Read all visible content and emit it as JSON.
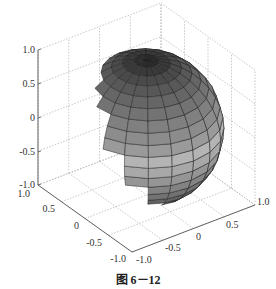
{
  "caption": "图 6－12",
  "colors": {
    "background": "#ffffff",
    "axis_line": "#555555",
    "grid_line": "#b0b0b0",
    "edge_line": "#222222",
    "band_colors": [
      "#2a2a2a",
      "#3a3a3a",
      "#4a4a4a",
      "#585858",
      "#666666",
      "#737373",
      "#808080",
      "#8c8c8c",
      "#9a9a9a",
      "#b4b4b4",
      "#a8a8a8",
      "#959595",
      "#838383",
      "#727272",
      "#626262",
      "#545454",
      "#474747",
      "#3c3c3c",
      "#333333",
      "#2c2c2c"
    ]
  },
  "chart_data": {
    "type": "surface3d",
    "title": "",
    "surface": "unit sphere x^2 + y^2 + z^2 = 1",
    "mesh": "20 x 20 faceted patches (MATLAB sphere)",
    "colormap": "gray, shaded by z",
    "xlabel": "",
    "ylabel": "",
    "zlabel": "",
    "xlim": [
      -1.0,
      1.0
    ],
    "ylim": [
      -1.0,
      1.0
    ],
    "zlim": [
      -1.0,
      1.0
    ],
    "xticks": [
      "-1.0",
      "-0.5",
      "0",
      "0.5",
      "1.0"
    ],
    "yticks": [
      "-1.0",
      "-0.5",
      "0",
      "0.5",
      "1.0"
    ],
    "zticks": [
      "-1.0",
      "-0.5",
      "0",
      "0.5",
      "1.0"
    ],
    "grid": true,
    "box": true,
    "view": "default 3D (az -37.5, el 30)"
  },
  "axes": {
    "z_ticks": [
      {
        "label": "1.0",
        "x": 38,
        "y": 50
      },
      {
        "label": "0.5",
        "x": 38,
        "y": 84
      },
      {
        "label": "0",
        "x": 38,
        "y": 118
      },
      {
        "label": "-0.5",
        "x": 38,
        "y": 152
      },
      {
        "label": "-1.0",
        "x": 38,
        "y": 185
      }
    ],
    "y_ticks": [
      {
        "label": "1.0",
        "x": 38,
        "y": 185
      },
      {
        "label": "0.5",
        "x": 61,
        "y": 202
      },
      {
        "label": "0",
        "x": 85,
        "y": 219
      },
      {
        "label": "-0.5",
        "x": 108,
        "y": 236
      },
      {
        "label": "-1.0",
        "x": 132,
        "y": 252
      }
    ],
    "x_ticks": [
      {
        "label": "-1.0",
        "x": 132,
        "y": 252
      },
      {
        "label": "-0.5",
        "x": 163,
        "y": 240
      },
      {
        "label": "0",
        "x": 194,
        "y": 229
      },
      {
        "label": "0.5",
        "x": 224,
        "y": 217
      },
      {
        "label": "1.0",
        "x": 255,
        "y": 205
      }
    ]
  }
}
